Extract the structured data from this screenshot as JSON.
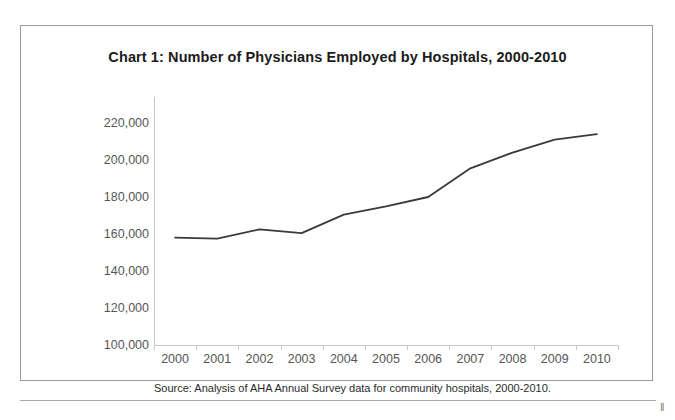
{
  "figure": {
    "title": "Chart 1: Number of Physicians Employed by Hospitals, 2000-2010",
    "source_note": "Source: Analysis of AHA Annual Survey data for community hospitals, 2000-2010.",
    "page_edge_mark": "‖",
    "line_color": "#3a3a3a",
    "axis_color": "#c8c8c8",
    "label_color": "#555555",
    "frame_color": "#9a9a9a"
  },
  "chart_data": {
    "type": "line",
    "title": "Chart 1: Number of Physicians Employed by Hospitals, 2000-2010",
    "xlabel": "",
    "ylabel": "",
    "categories": [
      "2000",
      "2001",
      "2002",
      "2003",
      "2004",
      "2005",
      "2006",
      "2007",
      "2008",
      "2009",
      "2010"
    ],
    "values": [
      158000,
      157500,
      162500,
      160500,
      170500,
      175000,
      180000,
      195500,
      204000,
      211000,
      214000
    ],
    "series": [
      {
        "name": "Physicians employed by hospitals",
        "values": [
          158000,
          157500,
          162500,
          160500,
          170500,
          175000,
          180000,
          195500,
          204000,
          211000,
          214000
        ]
      }
    ],
    "ylim": [
      100000,
      220000
    ],
    "ytick_values": [
      220000,
      200000,
      180000,
      160000,
      140000,
      120000,
      100000
    ],
    "ytick_labels": [
      "220,000",
      "200,000",
      "180,000",
      "160,000",
      "140,000",
      "120,000",
      "100,000"
    ],
    "xtick_labels": [
      "2000",
      "2001",
      "2002",
      "2003",
      "2004",
      "2005",
      "2006",
      "2007",
      "2008",
      "2009",
      "2010"
    ],
    "grid": false,
    "legend": false,
    "legend_position": "none",
    "annotations": [
      "Source: Analysis of AHA Annual Survey data for community hospitals, 2000-2010."
    ]
  }
}
